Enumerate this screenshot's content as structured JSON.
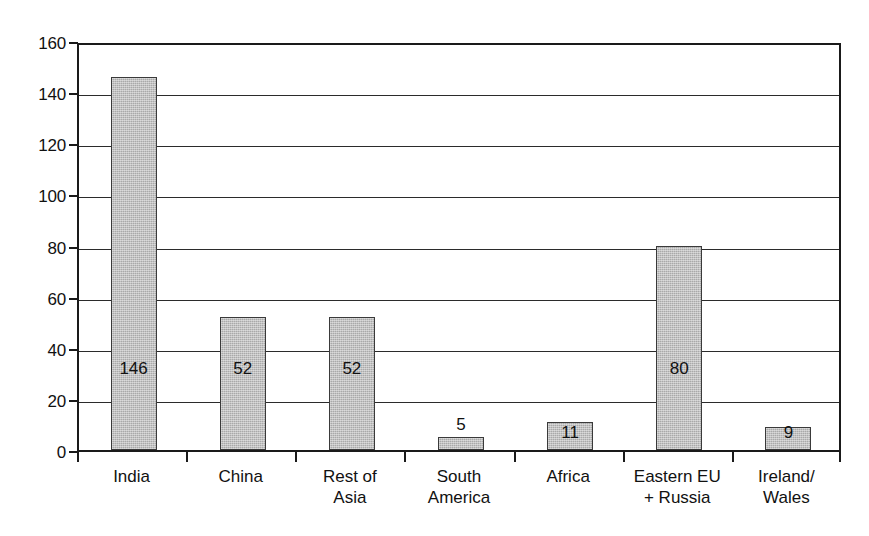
{
  "chart_data": {
    "type": "bar",
    "title": "",
    "subtitle": "",
    "xlabel": "",
    "ylabel": "",
    "ylim": [
      0,
      160
    ],
    "ytick_step": 20,
    "grid": true,
    "legend": false,
    "legend_position": "none",
    "bar_fill_color": "#a9a9a9",
    "bar_border_color": "#3a3a3a",
    "axis_color": "#1a1a1a",
    "background_color": "#ffffff",
    "categories": [
      "India",
      "China",
      "Rest of Asia",
      "South America",
      "Africa",
      "Eastern EU + Russia",
      "Ireland/ Wales"
    ],
    "category_label_lines": [
      [
        "India"
      ],
      [
        "China"
      ],
      [
        "Rest of",
        "Asia"
      ],
      [
        "South",
        "America"
      ],
      [
        "Africa"
      ],
      [
        "Eastern EU",
        "+ Russia"
      ],
      [
        "Ireland/",
        "Wales"
      ]
    ],
    "values": [
      146,
      52,
      52,
      5,
      11,
      80,
      9
    ],
    "data_labels": [
      "146",
      "52",
      "52",
      "5",
      "11",
      "80",
      "9"
    ],
    "data_label_placement": [
      "inside",
      "inside",
      "inside",
      "above",
      "inside-low",
      "inside",
      "inside-low"
    ],
    "yticks": [
      0,
      20,
      40,
      60,
      80,
      100,
      120,
      140,
      160
    ],
    "ytick_labels": [
      "0",
      "20",
      "40",
      "60",
      "80",
      "100",
      "120",
      "140",
      "160"
    ]
  }
}
